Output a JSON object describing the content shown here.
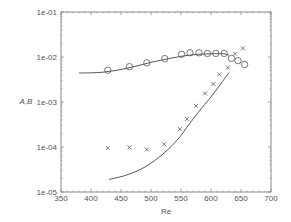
{
  "chart_data": {
    "type": "scatter",
    "title": "",
    "xlabel": "Re",
    "ylabel": "A,B",
    "xlim": [
      350,
      700
    ],
    "ylim": [
      1e-05,
      0.1
    ],
    "yscale": "log",
    "grid": false,
    "x_ticks": [
      "350",
      "400",
      "450",
      "500",
      "550",
      "600",
      "650",
      "700"
    ],
    "y_ticks": [
      "1e-05",
      "1e-04",
      "1e-03",
      "1e-02",
      "1e-01"
    ],
    "series": [
      {
        "name": "A (circles)",
        "marker": "circle",
        "points": [
          [
            428,
            0.0051
          ],
          [
            464,
            0.0061
          ],
          [
            493,
            0.0074
          ],
          [
            523,
            0.0092
          ],
          [
            551,
            0.0115
          ],
          [
            565,
            0.0124
          ],
          [
            580,
            0.0124
          ],
          [
            594,
            0.012
          ],
          [
            608,
            0.012
          ],
          [
            622,
            0.012
          ],
          [
            634,
            0.0093
          ],
          [
            645,
            0.0083
          ],
          [
            656,
            0.0068
          ]
        ]
      },
      {
        "name": "B (crosses)",
        "marker": "x",
        "points": [
          [
            428,
            9.5e-05
          ],
          [
            464,
            9.8e-05
          ],
          [
            493,
            8.8e-05
          ],
          [
            522,
            0.000115
          ],
          [
            548,
            0.00025
          ],
          [
            560,
            0.00042
          ],
          [
            575,
            0.00082
          ],
          [
            590,
            0.00155
          ],
          [
            604,
            0.0025
          ],
          [
            614,
            0.0041
          ],
          [
            628,
            0.0058
          ],
          [
            640,
            0.0118
          ],
          [
            653,
            0.0155
          ]
        ]
      },
      {
        "name": "A fit",
        "marker": "line",
        "points": [
          [
            380,
            0.0044
          ],
          [
            420,
            0.0046
          ],
          [
            460,
            0.0056
          ],
          [
            500,
            0.0076
          ],
          [
            540,
            0.0098
          ],
          [
            570,
            0.0112
          ],
          [
            600,
            0.0118
          ],
          [
            620,
            0.0118
          ],
          [
            630,
            0.011
          ]
        ]
      },
      {
        "name": "B fit",
        "marker": "line",
        "points": [
          [
            430,
            1.9e-05
          ],
          [
            460,
            2.4e-05
          ],
          [
            490,
            3.6e-05
          ],
          [
            520,
            7e-05
          ],
          [
            545,
            0.00015
          ],
          [
            565,
            0.00034
          ],
          [
            585,
            0.00075
          ],
          [
            600,
            0.0013
          ],
          [
            615,
            0.0024
          ],
          [
            630,
            0.0045
          ]
        ]
      }
    ]
  }
}
